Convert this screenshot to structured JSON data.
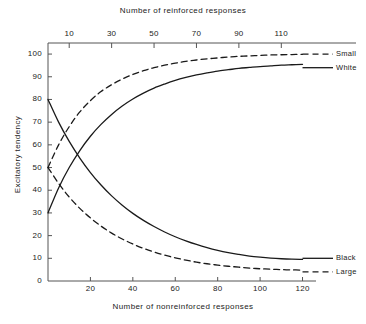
{
  "chart_data": {
    "type": "line",
    "title": "",
    "top_axis_label": "Number of reinforced responses",
    "xlabel": "Number of nonreinforced responses",
    "ylabel": "Excitatory tendency",
    "xlim": [
      0,
      124
    ],
    "ylim": [
      0,
      104
    ],
    "grid": false,
    "legend_position": "right-inline",
    "top_axis_ticks": [
      10,
      30,
      50,
      70,
      90,
      110
    ],
    "top_axis_tick_labels": [
      "10",
      "30",
      "50",
      "70",
      "90",
      "110"
    ],
    "bottom_axis_ticks": [
      20,
      40,
      60,
      80,
      100,
      120
    ],
    "bottom_axis_tick_labels": [
      "20",
      "40",
      "60",
      "80",
      "100",
      "120"
    ],
    "y_ticks": [
      0,
      10,
      20,
      30,
      40,
      50,
      60,
      70,
      80,
      90,
      100
    ],
    "y_tick_labels": [
      "0",
      "10",
      "20",
      "30",
      "40",
      "50",
      "60",
      "70",
      "80",
      "90",
      "100"
    ],
    "series": [
      {
        "name": "Small",
        "style": "dashed",
        "color": "#1a1a1a",
        "label_x": 120,
        "label_y": 100,
        "points": [
          [
            0,
            50
          ],
          [
            5,
            60
          ],
          [
            10,
            68
          ],
          [
            15,
            74.5
          ],
          [
            20,
            79.5
          ],
          [
            25,
            83.5
          ],
          [
            30,
            86.5
          ],
          [
            35,
            89
          ],
          [
            40,
            91
          ],
          [
            45,
            92.7
          ],
          [
            50,
            94
          ],
          [
            55,
            95.1
          ],
          [
            60,
            96
          ],
          [
            65,
            96.8
          ],
          [
            70,
            97.4
          ],
          [
            75,
            97.9
          ],
          [
            80,
            98.3
          ],
          [
            85,
            98.7
          ],
          [
            90,
            99
          ],
          [
            95,
            99.2
          ],
          [
            100,
            99.4
          ],
          [
            105,
            99.6
          ],
          [
            110,
            99.7
          ],
          [
            115,
            99.8
          ],
          [
            120,
            99.9
          ]
        ]
      },
      {
        "name": "White",
        "style": "solid",
        "color": "#1a1a1a",
        "label_x": 120,
        "label_y": 94,
        "points": [
          [
            0,
            30
          ],
          [
            5,
            41
          ],
          [
            10,
            50
          ],
          [
            15,
            57.5
          ],
          [
            20,
            63.8
          ],
          [
            25,
            69
          ],
          [
            30,
            73.4
          ],
          [
            35,
            77.1
          ],
          [
            40,
            80.2
          ],
          [
            45,
            82.8
          ],
          [
            50,
            85
          ],
          [
            55,
            86.8
          ],
          [
            60,
            88.4
          ],
          [
            65,
            89.7
          ],
          [
            70,
            90.8
          ],
          [
            75,
            91.7
          ],
          [
            80,
            92.5
          ],
          [
            85,
            93.1
          ],
          [
            90,
            93.7
          ],
          [
            95,
            94.1
          ],
          [
            100,
            94.5
          ],
          [
            105,
            94.8
          ],
          [
            110,
            95.1
          ],
          [
            115,
            95.3
          ],
          [
            120,
            95.5
          ]
        ]
      },
      {
        "name": "Black",
        "style": "solid",
        "color": "#1a1a1a",
        "label_x": 120,
        "label_y": 10,
        "points": [
          [
            0,
            80
          ],
          [
            5,
            70
          ],
          [
            10,
            61.5
          ],
          [
            15,
            54.2
          ],
          [
            20,
            47.8
          ],
          [
            25,
            42.3
          ],
          [
            30,
            37.5
          ],
          [
            35,
            33.4
          ],
          [
            40,
            29.8
          ],
          [
            45,
            26.7
          ],
          [
            50,
            24
          ],
          [
            55,
            21.6
          ],
          [
            60,
            19.5
          ],
          [
            65,
            17.7
          ],
          [
            70,
            16.1
          ],
          [
            75,
            14.7
          ],
          [
            80,
            13.5
          ],
          [
            85,
            12.5
          ],
          [
            90,
            11.7
          ],
          [
            95,
            11
          ],
          [
            100,
            10.5
          ],
          [
            105,
            10.1
          ],
          [
            110,
            9.8
          ],
          [
            115,
            9.6
          ],
          [
            120,
            9.5
          ]
        ]
      },
      {
        "name": "Large",
        "style": "dashed",
        "color": "#1a1a1a",
        "label_x": 120,
        "label_y": 4,
        "points": [
          [
            0,
            50
          ],
          [
            5,
            43
          ],
          [
            10,
            37
          ],
          [
            15,
            32
          ],
          [
            20,
            27.8
          ],
          [
            25,
            24.2
          ],
          [
            30,
            21.1
          ],
          [
            35,
            18.5
          ],
          [
            40,
            16.3
          ],
          [
            45,
            14.4
          ],
          [
            50,
            12.8
          ],
          [
            55,
            11.4
          ],
          [
            60,
            10.2
          ],
          [
            65,
            9.2
          ],
          [
            70,
            8.3
          ],
          [
            75,
            7.6
          ],
          [
            80,
            7
          ],
          [
            85,
            6.5
          ],
          [
            90,
            6.1
          ],
          [
            95,
            5.7
          ],
          [
            100,
            5.4
          ],
          [
            105,
            5.2
          ],
          [
            110,
            5
          ],
          [
            115,
            4.9
          ],
          [
            120,
            4.8
          ]
        ]
      }
    ]
  }
}
